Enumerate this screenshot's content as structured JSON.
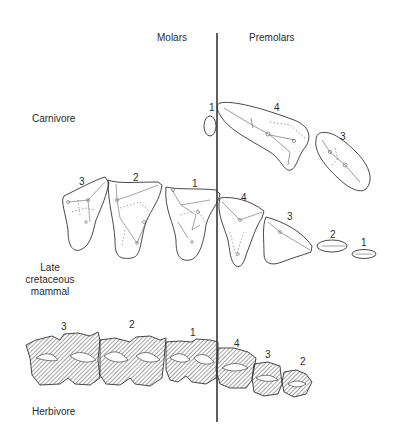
{
  "headers": {
    "molars": "Molars",
    "premolars": "Premolars"
  },
  "rows": [
    {
      "label": "Carnivore",
      "teeth": [
        {
          "group": "molar",
          "number": "1"
        },
        {
          "group": "premolar",
          "number": "4"
        },
        {
          "group": "premolar",
          "number": "3"
        }
      ]
    },
    {
      "label_lines": [
        "Late",
        "cretaceous",
        "mammal"
      ],
      "teeth": [
        {
          "group": "molar",
          "number": "3"
        },
        {
          "group": "molar",
          "number": "2"
        },
        {
          "group": "molar",
          "number": "1"
        },
        {
          "group": "premolar",
          "number": "4"
        },
        {
          "group": "premolar",
          "number": "3"
        },
        {
          "group": "premolar",
          "number": "2"
        },
        {
          "group": "premolar",
          "number": "1"
        }
      ]
    },
    {
      "label": "Herbivore",
      "teeth": [
        {
          "group": "molar",
          "number": "3"
        },
        {
          "group": "molar",
          "number": "2"
        },
        {
          "group": "molar",
          "number": "1"
        },
        {
          "group": "premolar",
          "number": "4"
        },
        {
          "group": "premolar",
          "number": "3"
        },
        {
          "group": "premolar",
          "number": "2"
        }
      ]
    }
  ],
  "colors": {
    "ink": "#2a2a2a",
    "divider": "#1a1a1a",
    "hatch": "#555555"
  }
}
